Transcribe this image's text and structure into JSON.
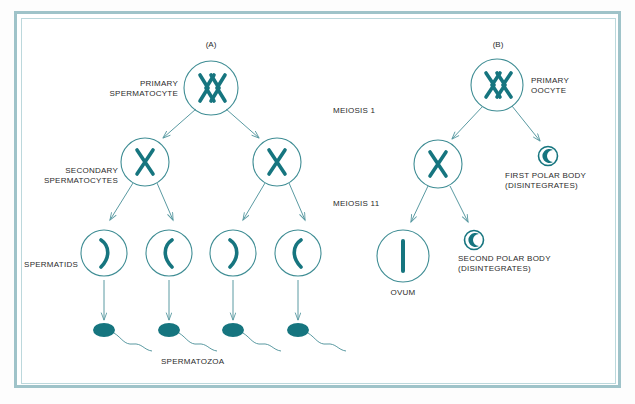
{
  "figure": {
    "background_color": "#ffffff",
    "frame_color": "#9fc3c9",
    "accent_color": "#16757f",
    "outline_color": "#3f8d94",
    "text_color": "#2b2b2b"
  },
  "panels": {
    "a_tag": "(A)",
    "b_tag": "(B)"
  },
  "stage_labels": {
    "meiosis_1": "MEIOSIS 1",
    "meiosis_2": "MEIOSIS 11"
  },
  "spermatogenesis": {
    "primary_label": "PRIMARY\nSPERMATOCYTE",
    "secondary_label": "SECONDARY\nSPERMATOCYTES",
    "spermatids_label": "SPERMATIDS",
    "spermatozoa_label": "SPERMATOZOA",
    "primary_cell": {
      "chromosome_glyph": "paired-XX",
      "count": 1
    },
    "secondary_cells": {
      "chromosome_glyph": "X",
      "count": 2
    },
    "spermatid_cells": {
      "chromosome_glyph": "single-chromatid",
      "count": 4,
      "curve_directions": [
        "right",
        "left",
        "right",
        "left"
      ]
    },
    "spermatozoa_cells": {
      "glyph": "sperm",
      "count": 4
    }
  },
  "oogenesis": {
    "primary_label": "PRIMARY\nOOCYTE",
    "first_polar_body_label": "FIRST POLAR BODY\n(DISINTEGRATES)",
    "second_polar_body_label": "SECOND POLAR BODY\n(DISINTEGRATES)",
    "ovum_label": "OVUM",
    "primary_cell": {
      "chromosome_glyph": "paired-XX",
      "count": 1
    },
    "secondary_cell": {
      "chromosome_glyph": "X",
      "count": 1
    },
    "ovum_cell": {
      "chromosome_glyph": "single-rod",
      "count": 1
    },
    "polar_bodies": {
      "glyph": "small-circle-with-comma",
      "count": 2
    }
  }
}
